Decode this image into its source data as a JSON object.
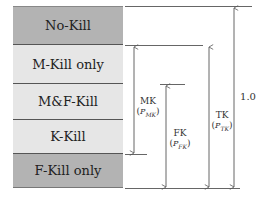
{
  "colors": {
    "dark": "#b3b3b3",
    "light": "#e6e6e6",
    "line": "#555555"
  },
  "bands": [
    {
      "label": "No-Kill",
      "top": 0,
      "height": 39,
      "shade": "dark"
    },
    {
      "label": "M-Kill only",
      "top": 39,
      "height": 39,
      "shade": "light"
    },
    {
      "label": "M&F-Kill",
      "top": 78,
      "height": 36,
      "shade": "light"
    },
    {
      "label": "K-Kill",
      "top": 114,
      "height": 34,
      "shade": "light"
    },
    {
      "label": "F-Kill only",
      "top": 148,
      "height": 34,
      "shade": "dark"
    }
  ],
  "measures": {
    "mk": {
      "name": "MK",
      "param": "P",
      "sub": "MK"
    },
    "fk": {
      "name": "FK",
      "param": "P",
      "sub": "FK"
    },
    "tk": {
      "name": "TK",
      "param": "P",
      "sub": "TK"
    },
    "total": {
      "name": "1.0"
    }
  }
}
